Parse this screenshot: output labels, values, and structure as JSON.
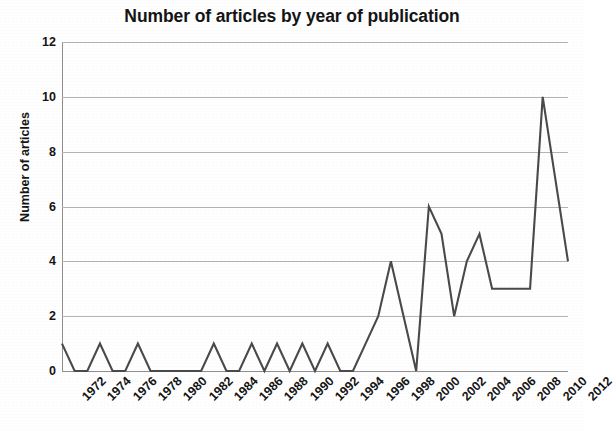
{
  "chart_data": {
    "type": "line",
    "title": "Number of articles by year of publication",
    "xlabel": "",
    "ylabel": "Number of articles",
    "ylim": [
      0,
      12
    ],
    "ytick_values": [
      0,
      2,
      4,
      6,
      8,
      10,
      12
    ],
    "ytick_labels": [
      "0",
      "2",
      "4",
      "6",
      "8",
      "10",
      "12"
    ],
    "xlim": [
      1972,
      2012
    ],
    "xtick_labels": [
      "1972",
      "1974",
      "1976",
      "1978",
      "1980",
      "1982",
      "1984",
      "1986",
      "1988",
      "1990",
      "1992",
      "1994",
      "1996",
      "1998",
      "2000",
      "2002",
      "2004",
      "2006",
      "2008",
      "2010",
      "2012"
    ],
    "xtick_values": [
      1972,
      1974,
      1976,
      1978,
      1980,
      1982,
      1984,
      1986,
      1988,
      1990,
      1992,
      1994,
      1996,
      1998,
      2000,
      2002,
      2004,
      2006,
      2008,
      2010,
      2012
    ],
    "grid": true,
    "grid_axis": "y",
    "legend": false,
    "legend_position": "none",
    "line_color": "#4a4a4a",
    "grid_color": "#b4b4b4",
    "x": [
      1972,
      1973,
      1974,
      1975,
      1976,
      1977,
      1978,
      1979,
      1980,
      1981,
      1982,
      1983,
      1984,
      1985,
      1986,
      1987,
      1988,
      1989,
      1990,
      1991,
      1992,
      1993,
      1994,
      1995,
      1996,
      1997,
      1998,
      1999,
      2000,
      2001,
      2002,
      2003,
      2004,
      2005,
      2006,
      2007,
      2008,
      2009,
      2010,
      2011,
      2012
    ],
    "series": [
      {
        "name": "Number of articles",
        "values": [
          1,
          0,
          0,
          1,
          0,
          0,
          1,
          0,
          0,
          0,
          0,
          0,
          1,
          0,
          0,
          1,
          0,
          1,
          0,
          1,
          0,
          1,
          0,
          0,
          1,
          2,
          4,
          2,
          0,
          6,
          5,
          2,
          4,
          5,
          3,
          3,
          3,
          3,
          10,
          7,
          4
        ]
      }
    ]
  }
}
